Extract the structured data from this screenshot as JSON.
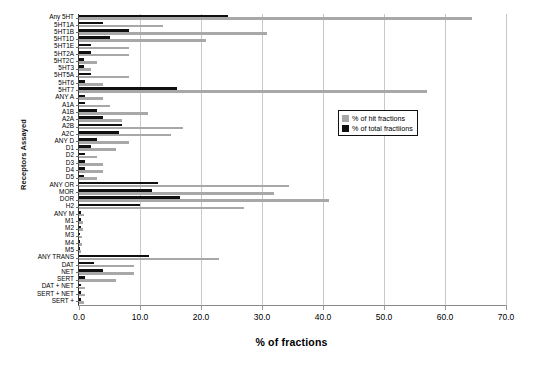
{
  "chart_data": {
    "type": "bar",
    "orientation": "horizontal",
    "title": "",
    "xlabel": "% of fractions",
    "ylabel": "Receptors Assayed",
    "xlim": [
      0.0,
      70.0
    ],
    "xticks": [
      "0.0",
      "10.0",
      "20.0",
      "30.0",
      "40.0",
      "50.0",
      "60.0",
      "70.0"
    ],
    "grid": true,
    "legend_position": "upper right",
    "categories": [
      "Any 5HT",
      "5HT1A",
      "5HT1B",
      "5HT1D",
      "5HT1E",
      "5HT2A",
      "5HT2C",
      "5HT3",
      "5HT5A",
      "5HT6",
      "5HT7",
      "ANY A",
      "A1A",
      "A1B",
      "A2A",
      "A2B",
      "A2C",
      "ANY D",
      "D1",
      "D2",
      "D3",
      "D4",
      "D5",
      "ANY OR",
      "MOR",
      "DOR",
      "H2",
      "ANY M",
      "M1",
      "M2",
      "M3",
      "M4",
      "M5",
      "ANY TRANS",
      "DAT",
      "NET",
      "SERT",
      "DAT + NET",
      "SERT + NET",
      "SERT +"
    ],
    "series": [
      {
        "name": "% of hit fractions",
        "color": "#a8a8a8",
        "values": [
          64.5,
          13.8,
          30.8,
          20.9,
          8.2,
          8.2,
          3.0,
          2.0,
          8.2,
          4.0,
          57.0,
          4.0,
          5.0,
          11.3,
          7.0,
          17.0,
          15.0,
          8.2,
          6.0,
          3.0,
          4.0,
          4.0,
          3.0,
          34.5,
          32.0,
          41.0,
          27.0,
          0.8,
          0.6,
          0.6,
          0.5,
          0.5,
          0.4,
          23.0,
          9.0,
          9.0,
          6.0,
          1.0,
          1.0,
          0.8
        ]
      },
      {
        "name": "% of total fractiions",
        "color": "#101010",
        "values": [
          24.5,
          4.0,
          8.2,
          5.0,
          2.0,
          2.0,
          0.8,
          0.8,
          2.0,
          1.0,
          16.0,
          1.0,
          1.0,
          3.0,
          4.0,
          7.0,
          6.5,
          3.0,
          2.0,
          1.0,
          1.0,
          1.0,
          0.8,
          13.0,
          12.0,
          16.5,
          10.0,
          0.4,
          0.3,
          0.3,
          0.2,
          0.2,
          0.2,
          11.5,
          2.5,
          4.0,
          1.0,
          0.4,
          0.4,
          0.3
        ]
      }
    ]
  },
  "legend": {
    "items": [
      {
        "label": "% of hit fractions",
        "swatch": "hit"
      },
      {
        "label": "% of total fractiions",
        "swatch": "total"
      }
    ]
  }
}
